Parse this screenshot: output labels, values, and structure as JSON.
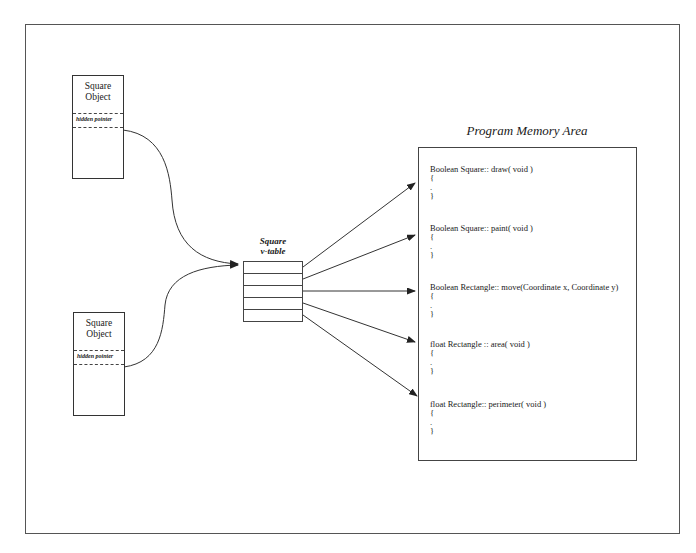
{
  "objects": [
    {
      "title_line1": "Square",
      "title_line2": "Object",
      "hidden_pointer": "hidden pointer"
    },
    {
      "title_line1": "Square",
      "title_line2": "Object",
      "hidden_pointer": "hidden pointer"
    }
  ],
  "vtable": {
    "title_line1": "Square",
    "title_line2": "v-table",
    "rows": 5
  },
  "memory": {
    "title": "Program Memory Area",
    "functions": [
      {
        "signature": "Boolean Square:: draw( void )",
        "open": "{",
        "body": ".",
        "close": "}"
      },
      {
        "signature": "Boolean Square:: paint( void )",
        "open": "{",
        "body": ".",
        "close": "}"
      },
      {
        "signature": "Boolean Rectangle:: move(Coordinate x, Coordinate y)",
        "open": "{",
        "body": ".",
        "close": "}"
      },
      {
        "signature": "float Rectangle :: area( void )",
        "open": "{",
        "body": ".",
        "close": "}"
      },
      {
        "signature": "float Rectangle:: perimeter( void )",
        "open": "{",
        "body": ".",
        "close": "}"
      }
    ]
  },
  "colors": {
    "line": "#333333",
    "background": "#ffffff"
  }
}
